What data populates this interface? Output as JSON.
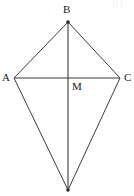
{
  "figure": {
    "type": "geometry-diagram",
    "shape_name": "kite",
    "canvas": {
      "width": 134,
      "height": 196,
      "background": "#ffffff"
    },
    "stroke_color": "#3b3b3b",
    "stroke_width": 1,
    "points": {
      "B": {
        "label": "B",
        "x": 68,
        "y": 22
      },
      "A": {
        "label": "A",
        "x": 14,
        "y": 78
      },
      "C": {
        "label": "C",
        "x": 120,
        "y": 78
      },
      "D": {
        "label": "",
        "x": 68,
        "y": 190
      },
      "M": {
        "label": "M",
        "x": 68,
        "y": 78
      }
    },
    "label_order": [
      "B",
      "A",
      "C",
      "M"
    ],
    "outline_path": "M 68 22 L 120 78 L 68 190 L 14 78 Z",
    "diagonals": [
      {
        "name": "horizontal-diagonal-AC",
        "x1": 14,
        "y1": 78,
        "x2": 120,
        "y2": 78
      },
      {
        "name": "vertical-diagonal-BD",
        "x1": 68,
        "y1": 22,
        "x2": 68,
        "y2": 190
      }
    ],
    "vertex_dots": [
      {
        "name": "vertex-dot-B",
        "x": 68,
        "y": 22,
        "r": 1.8
      },
      {
        "name": "vertex-dot-D",
        "x": 68,
        "y": 190,
        "r": 1.8
      }
    ]
  }
}
